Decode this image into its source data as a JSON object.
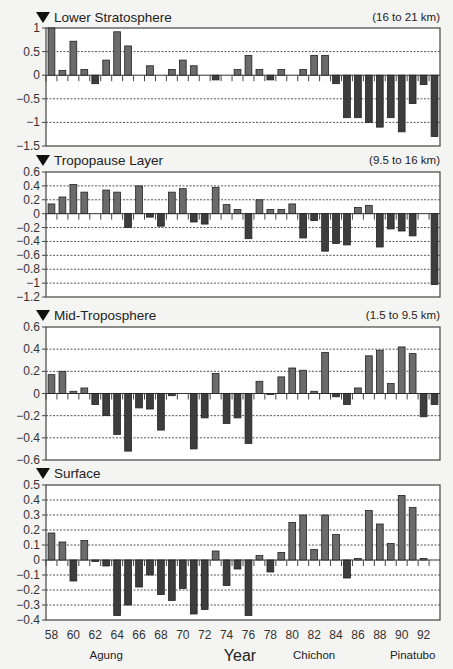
{
  "chart_data": {
    "type": "bar",
    "xlabel": "Year",
    "x_tick_labels": [
      "58",
      "60",
      "62",
      "64",
      "66",
      "68",
      "70",
      "72",
      "74",
      "76",
      "78",
      "80",
      "82",
      "84",
      "86",
      "88",
      "90",
      "92"
    ],
    "years": [
      58,
      59,
      60,
      61,
      62,
      63,
      64,
      65,
      66,
      67,
      68,
      69,
      70,
      71,
      72,
      73,
      74,
      75,
      76,
      77,
      78,
      79,
      80,
      81,
      82,
      83,
      84,
      85,
      86,
      87,
      88,
      89,
      90,
      91,
      92,
      93
    ],
    "annotations": [
      {
        "text": "Agung",
        "year": 63
      },
      {
        "text": "Chichon",
        "year": 82
      },
      {
        "text": "Pinatubo",
        "year": 91
      }
    ],
    "grid": true,
    "panels": [
      {
        "title": "Lower Stratosphere",
        "range_label": "(16 to 21 km)",
        "ylim": [
          -1.5,
          1
        ],
        "yticks": [
          1,
          0.5,
          0,
          -0.5,
          -1,
          -1.5
        ],
        "ytick_labels": [
          "1",
          "0.5",
          "0",
          "−0.5",
          "−1",
          "−1.5"
        ],
        "values": [
          1.0,
          0.1,
          0.72,
          0.12,
          -0.18,
          0.32,
          0.92,
          0.62,
          0.0,
          0.2,
          0.0,
          0.12,
          0.32,
          0.2,
          0.0,
          -0.1,
          0.0,
          0.12,
          0.42,
          0.12,
          -0.1,
          0.12,
          0.0,
          0.12,
          0.42,
          0.42,
          -0.18,
          -0.9,
          -0.9,
          -1.0,
          -1.1,
          -0.9,
          -1.2,
          -0.6,
          -0.2,
          -1.3
        ]
      },
      {
        "title": "Tropopause Layer",
        "range_label": "(9.5 to 16 km)",
        "ylim": [
          -1.2,
          0.6
        ],
        "yticks": [
          0.6,
          0.4,
          0.2,
          0,
          -0.2,
          -0.4,
          -0.6,
          -0.8,
          -1,
          -1.2
        ],
        "ytick_labels": [
          "0.6",
          "0.4",
          "0.2",
          "0",
          "−0.2",
          "−0.4",
          "−0.6",
          "−0.8",
          "−1",
          "−1.2"
        ],
        "values": [
          0.14,
          0.24,
          0.42,
          0.31,
          0.0,
          0.34,
          0.31,
          -0.2,
          0.4,
          -0.05,
          -0.18,
          0.31,
          0.36,
          -0.12,
          -0.15,
          0.38,
          0.13,
          0.06,
          -0.36,
          0.2,
          0.06,
          0.06,
          0.14,
          -0.35,
          -0.1,
          -0.54,
          -0.43,
          -0.45,
          0.09,
          0.12,
          -0.48,
          -0.22,
          -0.25,
          -0.32,
          0.0,
          -1.02
        ]
      },
      {
        "title": "Mid-Troposphere",
        "range_label": "(1.5 to 9.5 km)",
        "ylim": [
          -0.6,
          0.6
        ],
        "yticks": [
          0.6,
          0.4,
          0.2,
          0,
          -0.2,
          -0.4,
          -0.6
        ],
        "ytick_labels": [
          "0.6",
          "0.4",
          "0.2",
          "0",
          "−0.2",
          "−0.4",
          "−0.6"
        ],
        "values": [
          0.17,
          0.2,
          0.02,
          0.05,
          -0.1,
          -0.2,
          -0.37,
          -0.52,
          -0.13,
          -0.14,
          -0.33,
          -0.02,
          0.0,
          -0.5,
          -0.22,
          0.18,
          -0.27,
          -0.22,
          -0.45,
          0.11,
          -0.01,
          0.15,
          0.23,
          0.21,
          0.02,
          0.37,
          -0.03,
          -0.1,
          0.05,
          0.34,
          0.39,
          0.09,
          0.42,
          0.36,
          -0.21,
          -0.1
        ]
      },
      {
        "title": "Surface",
        "range_label": "",
        "ylim": [
          -0.4,
          0.5
        ],
        "yticks": [
          0.5,
          0.4,
          0.3,
          0.2,
          0.1,
          0,
          -0.1,
          -0.2,
          -0.3,
          -0.4
        ],
        "ytick_labels": [
          "0.5",
          "0.4",
          "0.3",
          "0.2",
          "0.1",
          "0",
          "−0.1",
          "−0.2",
          "−0.3",
          "−0.4"
        ],
        "values": [
          0.18,
          0.12,
          -0.14,
          0.13,
          -0.01,
          -0.04,
          -0.37,
          -0.3,
          -0.18,
          -0.1,
          -0.23,
          -0.27,
          -0.19,
          -0.36,
          -0.33,
          0.06,
          -0.17,
          -0.06,
          -0.37,
          0.03,
          -0.08,
          0.05,
          0.25,
          0.3,
          0.07,
          0.3,
          0.17,
          -0.12,
          0.01,
          0.33,
          0.24,
          0.11,
          0.43,
          0.35,
          0.01,
          0.0
        ]
      }
    ]
  }
}
